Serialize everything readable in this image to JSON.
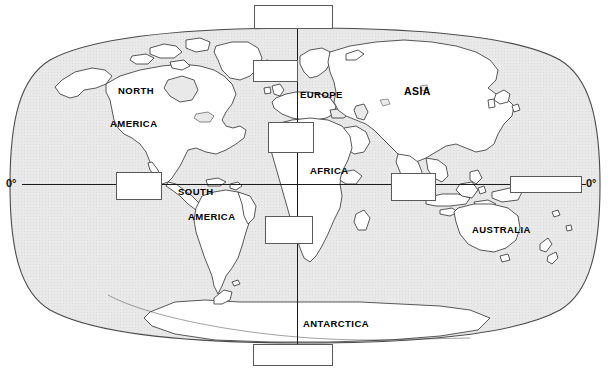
{
  "page": {
    "width": 610,
    "height": 371,
    "background_color": "#ffffff",
    "ocean_color": "#e8e8e8",
    "land_color": "#ffffff",
    "outline_color": "#3a3a3a",
    "box_border_color": "#5a5a5a",
    "line_color": "#1a1a1a"
  },
  "axis_labels": [
    {
      "id": "equator-left",
      "text": "0°",
      "x": 6,
      "y": 178
    },
    {
      "id": "equator-right",
      "text": "0°",
      "x": 586,
      "y": 178
    }
  ],
  "graticule": {
    "equator": {
      "label": "0°",
      "y": 184,
      "x1": 22,
      "x2": 586
    },
    "prime_meridian": {
      "label": "0°",
      "x": 297,
      "y1": 28,
      "y2": 344
    }
  },
  "continent_labels": [
    {
      "id": "north-america-line1",
      "text": "NORTH",
      "x": 118,
      "y": 85
    },
    {
      "id": "north-america-line2",
      "text": "AMERICA",
      "x": 110,
      "y": 118
    },
    {
      "id": "south-america-line1",
      "text": "SOUTH",
      "x": 178,
      "y": 186
    },
    {
      "id": "south-america-line2",
      "text": "AMERICA",
      "x": 188,
      "y": 211
    },
    {
      "id": "europe",
      "text": "EUROPE",
      "x": 300,
      "y": 89
    },
    {
      "id": "asia",
      "text": "ASIA",
      "x": 404,
      "y": 85
    },
    {
      "id": "africa",
      "text": "AFRICA",
      "x": 310,
      "y": 165
    },
    {
      "id": "australia",
      "text": "AUSTRALIA",
      "x": 472,
      "y": 224
    },
    {
      "id": "antarctica",
      "text": "ANTARCTICA",
      "x": 303,
      "y": 318
    }
  ],
  "answer_boxes": [
    {
      "id": "box-arctic-ocean",
      "name": "answer-box-top",
      "value": "",
      "x": 254,
      "y": 5,
      "w": 79,
      "h": 24
    },
    {
      "id": "box-north-atlantic",
      "name": "answer-box-north-atlantic",
      "value": "",
      "x": 253,
      "y": 60,
      "w": 45,
      "h": 22
    },
    {
      "id": "box-mediterranean",
      "name": "answer-box-mediterranean",
      "value": "",
      "x": 268,
      "y": 122,
      "w": 46,
      "h": 31
    },
    {
      "id": "box-south-atlantic",
      "name": "answer-box-south-atlantic",
      "value": "",
      "x": 265,
      "y": 216,
      "w": 48,
      "h": 28
    },
    {
      "id": "box-pacific-east",
      "name": "answer-box-pacific-east",
      "value": "",
      "x": 116,
      "y": 172,
      "w": 46,
      "h": 28
    },
    {
      "id": "box-indian-ocean",
      "name": "answer-box-indian-ocean",
      "value": "",
      "x": 391,
      "y": 173,
      "w": 45,
      "h": 28
    },
    {
      "id": "box-pacific-west",
      "name": "answer-box-pacific-west",
      "value": "",
      "x": 510,
      "y": 176,
      "w": 72,
      "h": 17
    },
    {
      "id": "box-southern-ocean",
      "name": "answer-box-bottom",
      "value": "",
      "x": 253,
      "y": 344,
      "w": 80,
      "h": 22
    }
  ]
}
